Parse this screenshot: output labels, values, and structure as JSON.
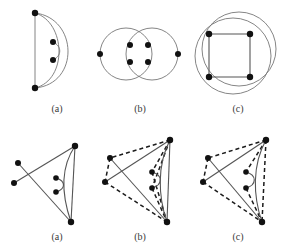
{
  "figure": {
    "background_color": "#ffffff",
    "vertex_color": "#111111",
    "edge_color": "#555555",
    "dashed_edge_color": "#1b1b1b",
    "rows": [
      {
        "row_name": "top-row",
        "panels": [
          {
            "label": "(a)",
            "label_x": 57,
            "label_y": 112,
            "description": "Two left vertices joined by a vertical segment and two right-bulging arcs; two interior vertices joined by a small curve",
            "vertices": [
              {
                "name": "v-top-left",
                "x": 35,
                "y": 13
              },
              {
                "name": "v-bottom-left",
                "x": 35,
                "y": 88
              },
              {
                "name": "v-inner-upper",
                "x": 53,
                "y": 42
              },
              {
                "name": "v-inner-lower",
                "x": 53,
                "y": 60
              }
            ],
            "edges": [
              {
                "type": "line",
                "from": "v-top-left",
                "to": "v-bottom-left"
              },
              {
                "type": "arc",
                "from": "v-top-left",
                "to": "v-bottom-left",
                "bulge": "right-large"
              },
              {
                "type": "arc",
                "from": "v-top-left",
                "to": "v-bottom-left",
                "bulge": "right-small"
              },
              {
                "type": "arc",
                "from": "v-inner-upper",
                "to": "v-inner-lower",
                "bulge": "right-tiny"
              }
            ]
          },
          {
            "label": "(b)",
            "label_x": 140,
            "label_y": 112,
            "description": "Two overlapping circles, four interior vertices, one vertex on the far left and one on the far right",
            "vertices": [
              {
                "name": "v-left-outer",
                "x": 100,
                "y": 54
              },
              {
                "name": "v-right-outer",
                "x": 178,
                "y": 54
              },
              {
                "name": "v-inner-top-left",
                "x": 130,
                "y": 45
              },
              {
                "name": "v-inner-top-right",
                "x": 148,
                "y": 45
              },
              {
                "name": "v-inner-bottom-left",
                "x": 130,
                "y": 62
              },
              {
                "name": "v-inner-bottom-right",
                "x": 148,
                "y": 62
              }
            ],
            "circles": [
              {
                "name": "circle-left",
                "cx": 126,
                "cy": 54,
                "r": 26
              },
              {
                "name": "circle-right",
                "cx": 152,
                "cy": 54,
                "r": 26
              }
            ]
          },
          {
            "label": "(c)",
            "label_x": 238,
            "label_y": 112,
            "description": "Square of four vertices overlaid on two large overlapping circles",
            "vertices": [
              {
                "name": "v-square-top-left",
                "x": 209,
                "y": 34
              },
              {
                "name": "v-square-top-right",
                "x": 250,
                "y": 34
              },
              {
                "name": "v-square-bottom-left",
                "x": 209,
                "y": 77
              },
              {
                "name": "v-square-bottom-right",
                "x": 250,
                "y": 77
              }
            ],
            "circles": [
              {
                "name": "circle-upper",
                "cx": 239,
                "cy": 49,
                "r": 37
              },
              {
                "name": "circle-lower",
                "cx": 233,
                "cy": 56,
                "r": 38
              }
            ]
          }
        ]
      },
      {
        "row_name": "bottom-row",
        "panels": [
          {
            "label": "(a)",
            "label_x": 57,
            "label_y": 240,
            "description": "Five outer vertices with crossing solid edges and two interior vertices joined by a small loop-like curve",
            "vertices": [
              {
                "name": "v-apex",
                "x": 75,
                "y": 146
              },
              {
                "name": "v-left-upper",
                "x": 18,
                "y": 163
              },
              {
                "name": "v-left-lower",
                "x": 14,
                "y": 183
              },
              {
                "name": "v-bottom",
                "x": 71,
                "y": 222
              },
              {
                "name": "v-inner-upper",
                "x": 56,
                "y": 178
              },
              {
                "name": "v-inner-lower",
                "x": 56,
                "y": 192
              }
            ],
            "edges": [
              {
                "type": "line",
                "from": "v-apex",
                "to": "v-left-lower"
              },
              {
                "type": "line",
                "from": "v-left-upper",
                "to": "v-bottom"
              },
              {
                "type": "line",
                "from": "v-apex",
                "to": "v-bottom"
              },
              {
                "type": "arc",
                "from": "v-apex",
                "to": "v-bottom",
                "bulge": "left"
              },
              {
                "type": "arc",
                "from": "v-inner-upper",
                "to": "v-inner-lower",
                "bulge": "right-tiny"
              }
            ]
          },
          {
            "label": "(b)",
            "label_x": 140,
            "label_y": 240,
            "description": "Same drawing with an added dashed quadrilateral and dashed chords meeting at the top-right apex",
            "vertices": [
              {
                "name": "v-apex",
                "x": 170,
                "y": 140
              },
              {
                "name": "v-left-upper",
                "x": 110,
                "y": 158
              },
              {
                "name": "v-left-lower",
                "x": 105,
                "y": 182
              },
              {
                "name": "v-bottom",
                "x": 167,
                "y": 222
              },
              {
                "name": "v-inner-upper",
                "x": 152,
                "y": 172
              },
              {
                "name": "v-inner-lower",
                "x": 152,
                "y": 188
              }
            ],
            "solid_edges": [
              {
                "from": "v-apex",
                "to": "v-left-lower"
              },
              {
                "from": "v-left-upper",
                "to": "v-bottom"
              },
              {
                "from": "v-apex",
                "to": "v-bottom"
              },
              {
                "from": "v-apex",
                "to": "v-bottom",
                "curved": true
              },
              {
                "from": "v-inner-upper",
                "to": "v-inner-lower",
                "curved": true
              }
            ],
            "dashed_edges": [
              {
                "from": "v-apex",
                "to": "v-left-upper"
              },
              {
                "from": "v-left-upper",
                "to": "v-left-lower"
              },
              {
                "from": "v-left-lower",
                "to": "v-bottom"
              },
              {
                "from": "v-apex",
                "to": "v-inner-upper"
              },
              {
                "from": "v-apex",
                "to": "v-inner-lower"
              },
              {
                "from": "v-inner-upper",
                "to": "v-bottom"
              },
              {
                "from": "v-inner-lower",
                "to": "v-bottom"
              }
            ]
          },
          {
            "label": "(c)",
            "label_x": 238,
            "label_y": 240,
            "description": "Variant of (b) with a different set of dashed chords from the apex to the bottom vertex",
            "vertices": [
              {
                "name": "v-apex",
                "x": 266,
                "y": 140
              },
              {
                "name": "v-left-upper",
                "x": 208,
                "y": 158
              },
              {
                "name": "v-left-lower",
                "x": 203,
                "y": 182
              },
              {
                "name": "v-bottom",
                "x": 262,
                "y": 222
              },
              {
                "name": "v-inner-upper",
                "x": 246,
                "y": 172
              },
              {
                "name": "v-inner-lower",
                "x": 246,
                "y": 188
              }
            ],
            "solid_edges": [
              {
                "from": "v-apex",
                "to": "v-left-lower"
              },
              {
                "from": "v-left-upper",
                "to": "v-bottom"
              },
              {
                "from": "v-apex",
                "to": "v-bottom"
              },
              {
                "from": "v-inner-upper",
                "to": "v-inner-lower",
                "curved": true
              }
            ],
            "dashed_edges": [
              {
                "from": "v-apex",
                "to": "v-left-upper"
              },
              {
                "from": "v-left-upper",
                "to": "v-left-lower"
              },
              {
                "from": "v-left-lower",
                "to": "v-bottom"
              },
              {
                "from": "v-apex",
                "to": "v-inner-upper"
              },
              {
                "from": "v-inner-lower",
                "to": "v-bottom"
              },
              {
                "from": "v-apex",
                "to": "v-bottom"
              }
            ]
          }
        ]
      }
    ]
  }
}
